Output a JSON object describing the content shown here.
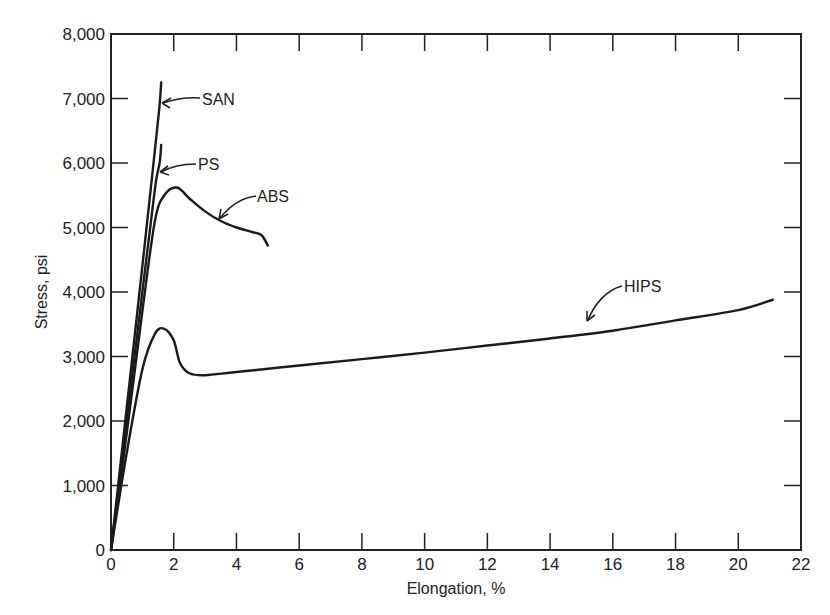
{
  "chart_data": {
    "type": "line",
    "title": "",
    "xlabel": "Elongation, %",
    "ylabel": "Stress, psi",
    "xlim": [
      0,
      22
    ],
    "ylim": [
      0,
      8000
    ],
    "grid": false,
    "legend_position": "inline annotations",
    "x_ticks": [
      "0",
      "2",
      "4",
      "6",
      "8",
      "10",
      "12",
      "14",
      "16",
      "18",
      "20",
      "22"
    ],
    "y_ticks": [
      "0",
      "1,000",
      "2,000",
      "3,000",
      "4,000",
      "5,000",
      "6,000",
      "7,000",
      "8,000"
    ],
    "series": [
      {
        "name": "SAN",
        "points": [
          [
            0,
            0
          ],
          [
            0.5,
            2200
          ],
          [
            1.0,
            4400
          ],
          [
            1.4,
            6200
          ],
          [
            1.55,
            6900
          ],
          [
            1.6,
            7250
          ]
        ]
      },
      {
        "name": "PS",
        "points": [
          [
            0,
            0
          ],
          [
            0.5,
            2000
          ],
          [
            1.0,
            4000
          ],
          [
            1.4,
            5600
          ],
          [
            1.55,
            6000
          ],
          [
            1.6,
            6280
          ]
        ]
      },
      {
        "name": "ABS",
        "points": [
          [
            0,
            0
          ],
          [
            0.5,
            1800
          ],
          [
            1.0,
            3700
          ],
          [
            1.4,
            5100
          ],
          [
            1.7,
            5500
          ],
          [
            2.1,
            5620
          ],
          [
            2.5,
            5450
          ],
          [
            3.0,
            5250
          ],
          [
            3.5,
            5100
          ],
          [
            4.0,
            5000
          ],
          [
            4.5,
            4930
          ],
          [
            4.8,
            4880
          ],
          [
            5.0,
            4720
          ]
        ]
      },
      {
        "name": "HIPS",
        "points": [
          [
            0,
            0
          ],
          [
            0.5,
            1500
          ],
          [
            1.0,
            2800
          ],
          [
            1.4,
            3350
          ],
          [
            1.7,
            3430
          ],
          [
            2.0,
            3250
          ],
          [
            2.2,
            2900
          ],
          [
            2.5,
            2740
          ],
          [
            3.0,
            2710
          ],
          [
            4.0,
            2760
          ],
          [
            6.0,
            2860
          ],
          [
            8.0,
            2960
          ],
          [
            10.0,
            3060
          ],
          [
            12.0,
            3170
          ],
          [
            14.0,
            3280
          ],
          [
            16.0,
            3400
          ],
          [
            18.0,
            3560
          ],
          [
            20.0,
            3720
          ],
          [
            21.1,
            3880
          ]
        ]
      }
    ],
    "annotations": [
      {
        "text": "SAN",
        "arrow_to": [
          1.6,
          6900
        ]
      },
      {
        "text": "PS",
        "arrow_to": [
          1.55,
          5900
        ]
      },
      {
        "text": "ABS",
        "arrow_to": [
          3.5,
          5100
        ]
      },
      {
        "text": "HIPS",
        "arrow_to": [
          15.2,
          3450
        ]
      }
    ]
  },
  "labels": {
    "xlabel": "Elongation, %",
    "ylabel": "Stress, psi",
    "san": "SAN",
    "ps": "PS",
    "abs": "ABS",
    "hips": "HIPS"
  }
}
